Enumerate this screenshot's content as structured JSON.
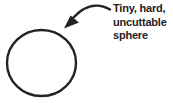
{
  "diagram": {
    "label": {
      "full_text": "Tiny, hard, uncuttable sphere",
      "lines": [
        "Tiny, hard,",
        "uncuttable",
        "sphere"
      ]
    },
    "shapes": {
      "sphere": "circle-outline",
      "pointer": "curved-arrow"
    },
    "colors": {
      "ink": "#262223",
      "background": "#ffffff"
    }
  }
}
